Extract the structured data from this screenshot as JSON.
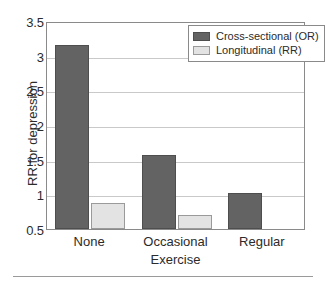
{
  "chart_data": {
    "type": "bar",
    "title": "",
    "subtitle": "",
    "xlabel": "Exercise",
    "ylabel": "RR for depression",
    "categories": [
      "None",
      "Occasional",
      "Regular"
    ],
    "series": [
      {
        "name": "Cross-sectional (OR)",
        "color": "#636363",
        "values": [
          3.15,
          1.57,
          1.02
        ]
      },
      {
        "name": "Longitudinal (RR)",
        "color": "#e3e3e3",
        "values": [
          0.88,
          0.7,
          null
        ]
      }
    ],
    "ylim": [
      0.5,
      3.5
    ],
    "yticks": [
      0.5,
      1,
      1.5,
      2,
      2.5,
      3,
      3.5
    ],
    "ytick_labels": [
      "0.5",
      "1",
      "1.5",
      "2",
      "2.5",
      "3",
      "3.5"
    ],
    "grid": true,
    "grid_axis": "y",
    "legend_position": "top-right",
    "legend_entries": [
      "Cross-sectional (OR)",
      "Longitudinal (RR)"
    ],
    "annotations": []
  },
  "axes": {
    "y_axis_label": "RR for depression",
    "x_axis_label": "Exercise"
  },
  "legend": {
    "items": [
      {
        "label": "Cross-sectional (OR)",
        "swatch": "dark-gray-swatch"
      },
      {
        "label": "Longitudinal (RR)",
        "swatch": "light-gray-swatch"
      }
    ]
  },
  "colors": {
    "cross_sectional": "#636363",
    "longitudinal": "#e3e3e3",
    "gridline": "#c9c9c9",
    "frame": "#8a8a8a",
    "text": "#2b2b2b",
    "background": "#ffffff"
  }
}
